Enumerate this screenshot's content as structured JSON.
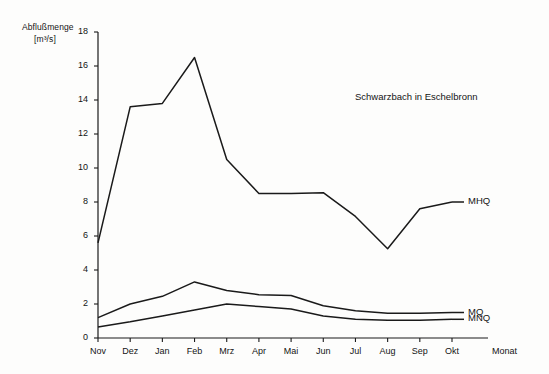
{
  "chart_data": {
    "type": "line",
    "title": "Schwarzbach in Eschelbronn",
    "ylabel_line1": "Abflußmenge",
    "ylabel_line2": "[m³/s]",
    "xlabel": "Monat",
    "categories": [
      "Nov",
      "Dez",
      "Jan",
      "Feb",
      "Mrz",
      "Apr",
      "Mai",
      "Jun",
      "Jul",
      "Aug",
      "Sep",
      "Okt"
    ],
    "yticks": [
      "0",
      "2",
      "4",
      "6",
      "8",
      "10",
      "12",
      "14",
      "16",
      "18"
    ],
    "ylim": [
      0,
      18
    ],
    "grid": false,
    "legend_position": "right-inline",
    "series": [
      {
        "name": "MHQ",
        "values": [
          5.6,
          13.6,
          13.8,
          16.5,
          10.5,
          8.5,
          8.5,
          8.55,
          7.15,
          5.25,
          7.6,
          8.0
        ]
      },
      {
        "name": "MQ",
        "values": [
          1.2,
          2.0,
          2.45,
          3.3,
          2.8,
          2.55,
          2.5,
          1.9,
          1.6,
          1.45,
          1.45,
          1.5
        ]
      },
      {
        "name": "MNQ",
        "values": [
          0.65,
          0.95,
          1.3,
          1.65,
          2.0,
          1.85,
          1.7,
          1.3,
          1.1,
          1.05,
          1.05,
          1.1
        ]
      }
    ]
  }
}
